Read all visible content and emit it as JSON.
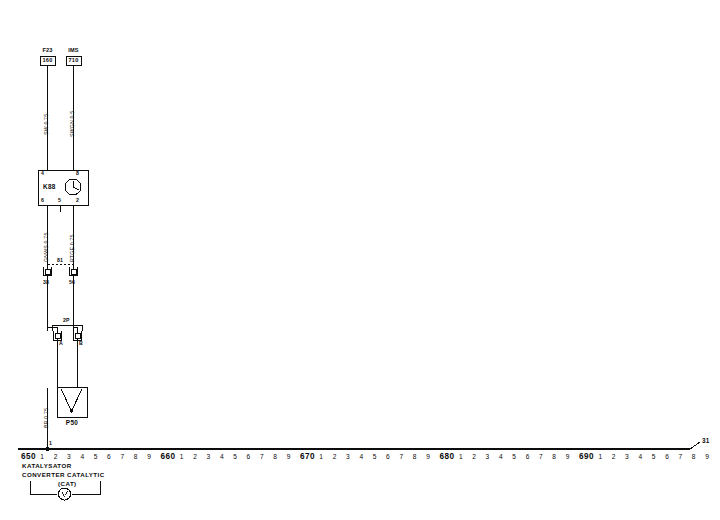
{
  "diagram": {
    "title": "KATALYSATOR",
    "subtitle": "CONVERTER CATALYTIC",
    "subtitle2": "(CAT)",
    "ink_color": "#0d0d0d",
    "background": "#ffffff"
  },
  "top_references": [
    {
      "name": "ref-f23",
      "code": "F23",
      "page": "160",
      "x": 47
    },
    {
      "name": "ref-ims",
      "code": "IMS",
      "page": "710",
      "x": 73
    }
  ],
  "wire_labels_upper": [
    {
      "name": "wire-sw-075",
      "text": "SW 0.75",
      "x": 44,
      "y": 135
    },
    {
      "name": "wire-swgn-05",
      "text": "SWGN 0.5",
      "x": 70,
      "y": 137
    }
  ],
  "wire_labels_lower": [
    {
      "name": "wire-gnw-075",
      "text": "GNWS 0.75",
      "x": 44,
      "y": 262
    },
    {
      "name": "wire-rtge-075",
      "text": "RTGE 0.75",
      "x": 70,
      "y": 262
    }
  ],
  "wire_label_ground": {
    "name": "wire-br-075",
    "text": "BR 0.75",
    "x": 44,
    "y": 428
  },
  "relay": {
    "name": "K88",
    "label": "K88",
    "symbol": "clock-icon",
    "pins_top": [
      "4",
      "8"
    ],
    "pins_bottom": [
      "6",
      "5",
      "2"
    ]
  },
  "connector_81": {
    "label": "81",
    "pins": [
      "38",
      "56"
    ]
  },
  "connector_2p": {
    "label": "2P",
    "pins": [
      "A",
      "B"
    ]
  },
  "sensor": {
    "label": "P50",
    "symbol": "lambda-probe-icon"
  },
  "ground_bus": {
    "terminal_label": "31",
    "decades": [
      {
        "label": "650",
        "ticks": [
          "1",
          "2",
          "3",
          "4",
          "5",
          "6",
          "7",
          "8",
          "9"
        ]
      },
      {
        "label": "660",
        "ticks": [
          "1",
          "2",
          "3",
          "4",
          "5",
          "6",
          "7",
          "8",
          "9"
        ]
      },
      {
        "label": "670",
        "ticks": [
          "1",
          "2",
          "3",
          "4",
          "5",
          "6",
          "7",
          "8",
          "9"
        ]
      },
      {
        "label": "680",
        "ticks": [
          "1",
          "2",
          "3",
          "4",
          "5",
          "6",
          "7",
          "8",
          "9"
        ]
      },
      {
        "label": "690",
        "ticks": [
          "1",
          "2",
          "3",
          "4",
          "5",
          "6",
          "7",
          "8",
          "9"
        ]
      }
    ]
  },
  "ground_symbol": {
    "name": "ground-node-icon",
    "marker": "1"
  },
  "legend_bracket": {
    "name": "legend-bracket",
    "icon": "lambda-circle-icon"
  }
}
